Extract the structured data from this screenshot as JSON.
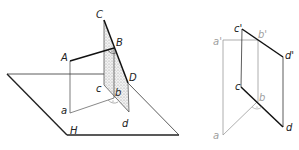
{
  "figure": {
    "colors": {
      "line": "#222222",
      "thin": "#555555",
      "gray": "#9a9a9a",
      "shade": "#d8d8d8"
    },
    "left_view": {
      "labels": {
        "C": "C",
        "B": "B",
        "A": "A",
        "D": "D",
        "c": "c",
        "b": "b",
        "a": "a",
        "d": "d",
        "H": "H"
      }
    },
    "right_view": {
      "labels": {
        "a_prime": "a'",
        "c_prime": "c'",
        "b_prime": "b'",
        "d_prime": "d'",
        "c": "c",
        "b": "b",
        "a": "a",
        "d": "d"
      }
    }
  }
}
